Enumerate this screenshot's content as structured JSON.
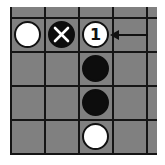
{
  "board": {
    "background": "#808080",
    "line_color": "#151515",
    "columns": 4,
    "rows": 4,
    "cell_size": 34,
    "stones": [
      {
        "col": 0,
        "row": 0,
        "color": "white",
        "marker": ""
      },
      {
        "col": 1,
        "row": 0,
        "color": "black",
        "marker": "x"
      },
      {
        "col": 2,
        "row": 0,
        "color": "white",
        "marker": "1"
      },
      {
        "col": 2,
        "row": 1,
        "color": "black",
        "marker": ""
      },
      {
        "col": 2,
        "row": 2,
        "color": "black",
        "marker": ""
      },
      {
        "col": 2,
        "row": 3,
        "color": "white",
        "marker": ""
      }
    ],
    "arrow": {
      "points_to": "stone-1",
      "direction": "left"
    }
  },
  "labels": {
    "move_number": "1"
  }
}
